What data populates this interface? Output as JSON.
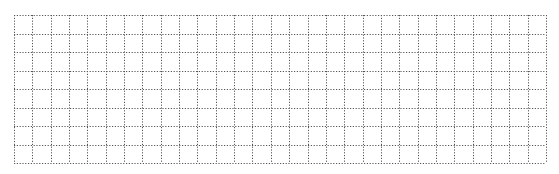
{
  "grid": {
    "left": 14,
    "top": 15,
    "right": 546,
    "bottom": 163,
    "columns": 29,
    "rows": 8,
    "line_color": "#555555",
    "background": "#ffffff",
    "dash": "1.2 1.6"
  }
}
